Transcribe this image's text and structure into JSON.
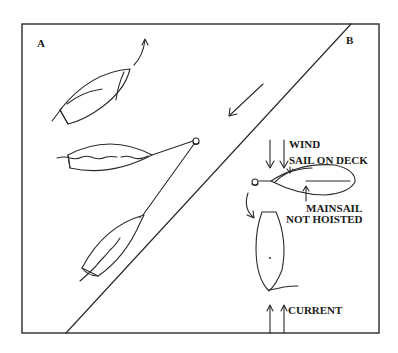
{
  "diagram": {
    "type": "sailing-maneuver-illustration",
    "panels": [
      {
        "id": "A",
        "label": "A",
        "description": "Boat sailing off, then approaching anchor, then at anchor line"
      },
      {
        "id": "B",
        "label": "B",
        "description": "Anchored boat with wind and current from different directions"
      }
    ],
    "annotations": {
      "wind": "WIND",
      "sail_on_deck": "SAIL ON DECK",
      "mainsail_line1": "MAINSAIL",
      "mainsail_line2": "NOT HOISTED",
      "current": "CURRENT"
    },
    "colors": {
      "stroke": "#2a2a2a",
      "background": "#ffffff"
    }
  }
}
